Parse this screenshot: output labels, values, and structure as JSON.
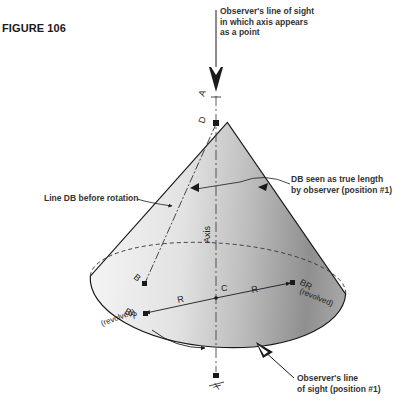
{
  "figure": {
    "label": "FIGURE 106"
  },
  "annotations": {
    "top_sight": "Observer's line of sight\nin which axis appears\nas a point",
    "line_db": "Line DB before rotation",
    "true_length": "DB seen as true length\nby observer (position #1)",
    "bottom_sight": "Observer's line\nof sight (position #1)"
  },
  "points": {
    "A": "A",
    "D": "D",
    "B": "B",
    "C": "C",
    "X": "X",
    "BR_left": "BR",
    "BR_right": "BR",
    "revolved_left": "(revolved)",
    "revolved_right": "(revolved)",
    "R_left": "R",
    "R_right": "R",
    "axis": "Axis"
  },
  "colors": {
    "ink": "#1a1a1a",
    "cone_light": "#f2f2f2",
    "cone_dark": "#8c8c8c"
  }
}
